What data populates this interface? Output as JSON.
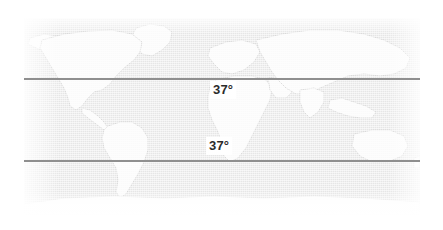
{
  "figure": {
    "type": "world-map",
    "projection": "equirectangular",
    "width": 443,
    "height": 230,
    "background_color": "#ffffff"
  },
  "map": {
    "ocean_color": "#e6e6e6",
    "land_color": "#fafafa",
    "coastline_color": "#c9c9c9",
    "plate": {
      "left": 24,
      "top": 18,
      "width": 396,
      "height": 197
    }
  },
  "latitude_lines": [
    {
      "id": "north",
      "label": "37°",
      "hemisphere": "north",
      "color": "#8f8f8f",
      "y": 78,
      "label_position": {
        "left": 210,
        "top": 81
      }
    },
    {
      "id": "south",
      "label": "37°",
      "hemisphere": "south",
      "color": "#8f8f8f",
      "y": 160,
      "label_position": {
        "left": 206,
        "top": 137
      }
    }
  ],
  "labels": {
    "north_latitude": "37°",
    "south_latitude": "37°"
  },
  "landmasses": [
    {
      "name": "north-america"
    },
    {
      "name": "greenland"
    },
    {
      "name": "south-america"
    },
    {
      "name": "africa"
    },
    {
      "name": "europe"
    },
    {
      "name": "asia"
    },
    {
      "name": "australia"
    },
    {
      "name": "antarctica"
    }
  ]
}
